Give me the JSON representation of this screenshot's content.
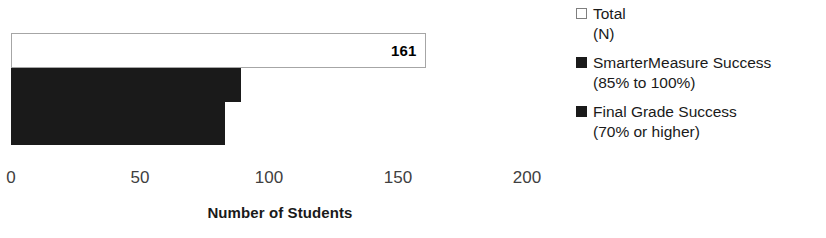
{
  "chart_data": {
    "type": "bar",
    "orientation": "horizontal",
    "title": "",
    "xlabel": "Number of Students",
    "ylabel": "",
    "xlim": [
      0,
      200
    ],
    "x_ticks": [
      "0",
      "50",
      "100",
      "150",
      "200"
    ],
    "x_tick_values": [
      0,
      50,
      100,
      150,
      200
    ],
    "grid": false,
    "legend_position": "right",
    "categories": [
      ""
    ],
    "series": [
      {
        "name": "Total (N)",
        "legend_line1": "Total",
        "legend_line2": "(N)",
        "values": [
          161
        ],
        "data_label": "161",
        "fill": "#ffffff",
        "border": "#a6a6a6",
        "marker": "hollow-square"
      },
      {
        "name": "SmarterMeasure Success (85% to 100%)",
        "legend_line1": "SmarterMeasure Success",
        "legend_line2": "(85% to 100%)",
        "values": [
          89
        ],
        "data_label": "",
        "fill": "#1a1a1a",
        "border": "#1a1a1a",
        "marker": "solid-square"
      },
      {
        "name": "Final Grade Success (70% or higher)",
        "legend_line1": "Final Grade Success",
        "legend_line2": "(70% or higher)",
        "values": [
          83
        ],
        "data_label": "",
        "fill": "#1a1a1a",
        "border": "#1a1a1a",
        "marker": "solid-square"
      }
    ]
  },
  "axis": {
    "title": "Number of Students",
    "ticks": [
      "0",
      "50",
      "100",
      "150",
      "200"
    ]
  },
  "labels": {
    "total_value": "161"
  },
  "legend": {
    "entries": [
      {
        "line1": "Total",
        "line2": "(N)"
      },
      {
        "line1": "SmarterMeasure Success",
        "line2": "(85% to 100%)"
      },
      {
        "line1": "Final Grade Success",
        "line2": "(70% or higher)"
      }
    ]
  }
}
